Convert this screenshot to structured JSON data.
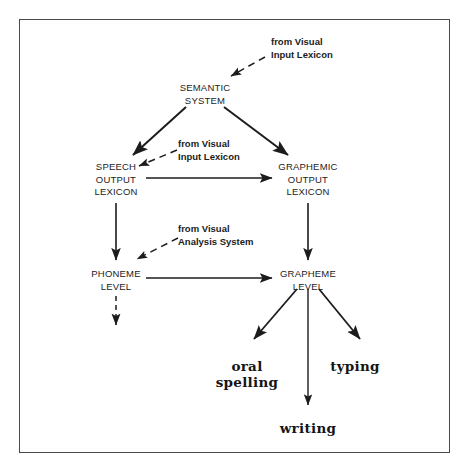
{
  "diagram": {
    "frame": {
      "border_color": "#4a4a4a"
    },
    "nodes": [
      {
        "id": "semantic-system",
        "label": "SEMANTIC\nSYSTEM",
        "x": 205,
        "y": 82
      },
      {
        "id": "speech-output-lexicon",
        "label": "SPEECH\nOUTPUT\nLEXICON",
        "x": 116,
        "y": 161
      },
      {
        "id": "graphemic-output-lexicon",
        "label": "GRAPHEMIC\nOUTPUT\nLEXICON",
        "x": 308,
        "y": 161
      },
      {
        "id": "phoneme-level",
        "label": "PHONEME\nLEVEL",
        "x": 116,
        "y": 268
      },
      {
        "id": "grapheme-level",
        "label": "GRAPHEME\nLEVEL",
        "x": 308,
        "y": 268
      }
    ],
    "edge_labels": [
      {
        "id": "from-visual-input-lexicon-top",
        "label": "from Visual\nInput Lexicon",
        "x": 271,
        "y": 36
      },
      {
        "id": "from-visual-input-lexicon-mid",
        "label": "from Visual\nInput Lexicon",
        "x": 178,
        "y": 138
      },
      {
        "id": "from-visual-analysis-system",
        "label": "from Visual\nAnalysis System",
        "x": 178,
        "y": 223
      }
    ],
    "outputs": [
      {
        "id": "oral-spelling",
        "label": "oral\nspelling",
        "x": 247,
        "y": 358
      },
      {
        "id": "typing",
        "label": "typing",
        "x": 355,
        "y": 358
      },
      {
        "id": "writing",
        "label": "writing",
        "x": 308,
        "y": 420
      }
    ],
    "colors": {
      "line": "#1c1c1c",
      "text": "#1c1c1c",
      "background": "#ffffff"
    }
  }
}
